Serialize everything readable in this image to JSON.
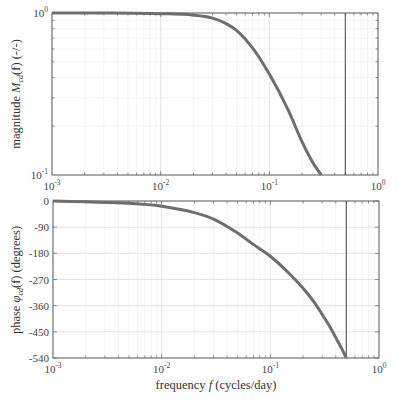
{
  "chart_data": [
    {
      "type": "line",
      "title": "",
      "xlabel": "",
      "ylabel": "magnitude M_cd(f) (-/-)",
      "xscale": "log",
      "yscale": "log",
      "xlim": [
        0.001,
        1
      ],
      "ylim": [
        0.1,
        1
      ],
      "grid": true,
      "x_ticks": [
        "10^-3",
        "10^-2",
        "10^-1",
        "10^0"
      ],
      "y_ticks": [
        "10^-1",
        "10^0"
      ],
      "series": [
        {
          "name": "magnitude",
          "color": "#6e6e6e",
          "x": [
            0.001,
            0.003,
            0.01,
            0.02,
            0.03,
            0.04,
            0.05,
            0.07,
            0.1,
            0.15,
            0.2,
            0.25,
            0.3
          ],
          "y": [
            1.0,
            1.0,
            0.99,
            0.97,
            0.93,
            0.86,
            0.78,
            0.61,
            0.42,
            0.25,
            0.16,
            0.12,
            0.1
          ]
        }
      ],
      "vlines": [
        {
          "x": 0.5,
          "color": "#444444"
        }
      ]
    },
    {
      "type": "line",
      "title": "",
      "xlabel": "frequency f (cycles/day)",
      "ylabel": "phase φ_cd(f) (degrees)",
      "xscale": "log",
      "yscale": "linear",
      "xlim": [
        0.001,
        1
      ],
      "ylim": [
        -540,
        0
      ],
      "grid": true,
      "x_ticks": [
        "10^-3",
        "10^-2",
        "10^-1",
        "10^0"
      ],
      "y_ticks": [
        0,
        -90,
        -180,
        -270,
        -360,
        -450,
        -540
      ],
      "series": [
        {
          "name": "phase",
          "color": "#6e6e6e",
          "x": [
            0.001,
            0.002,
            0.005,
            0.01,
            0.02,
            0.03,
            0.05,
            0.07,
            0.1,
            0.15,
            0.2,
            0.25,
            0.3,
            0.35,
            0.4,
            0.45,
            0.5
          ],
          "y": [
            0,
            -3,
            -8,
            -18,
            -40,
            -62,
            -110,
            -150,
            -190,
            -250,
            -300,
            -345,
            -390,
            -430,
            -470,
            -505,
            -540
          ]
        }
      ],
      "vlines": [
        {
          "x": 0.5,
          "color": "#444444"
        }
      ]
    }
  ],
  "labels": {
    "top_ylabel_pre": "magnitude ",
    "top_ylabel_sym": "M",
    "top_ylabel_sub": "cd",
    "top_ylabel_post": "(f) (-/-)",
    "bottom_ylabel_pre": "phase ",
    "bottom_ylabel_sym": "φ",
    "bottom_ylabel_sub": "cd",
    "bottom_ylabel_post": "(f) (degrees)",
    "xlabel_pre": "frequency ",
    "xlabel_sym": "f",
    "xlabel_post": " (cycles/day)"
  }
}
